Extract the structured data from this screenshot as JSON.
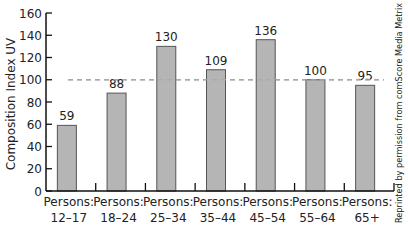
{
  "chart_data": {
    "type": "bar",
    "title": "",
    "xlabel": "",
    "ylabel": "Composition Index UV",
    "ylim": [
      0,
      160
    ],
    "yticks": [
      0,
      20,
      40,
      60,
      80,
      100,
      120,
      140,
      160
    ],
    "grid": false,
    "legend": null,
    "categories": [
      "Persons: 12-17",
      "Persons: 18-24",
      "Persons: 25-34",
      "Persons: 35-44",
      "Persons: 45-54",
      "Persons: 55-64",
      "Persons: 65+"
    ],
    "category_lines": [
      [
        "Persons:",
        "12–17"
      ],
      [
        "Persons:",
        "18–24"
      ],
      [
        "Persons:",
        "25–34"
      ],
      [
        "Persons:",
        "35–44"
      ],
      [
        "Persons:",
        "45–54"
      ],
      [
        "Persons:",
        "55–64"
      ],
      [
        "Persons:",
        "65+"
      ]
    ],
    "values": [
      59,
      88,
      130,
      109,
      136,
      100,
      95
    ],
    "reference_line": {
      "value": 100,
      "style": "dashed",
      "color": "#aaaaaa"
    },
    "bar_color": "#b5b5b5",
    "bar_edge_color": "#555555",
    "annotations": [
      "Reprinted by permission from comScore Media Metrix"
    ]
  },
  "credit": "Reprinted by permission from comScore Media Metrix"
}
